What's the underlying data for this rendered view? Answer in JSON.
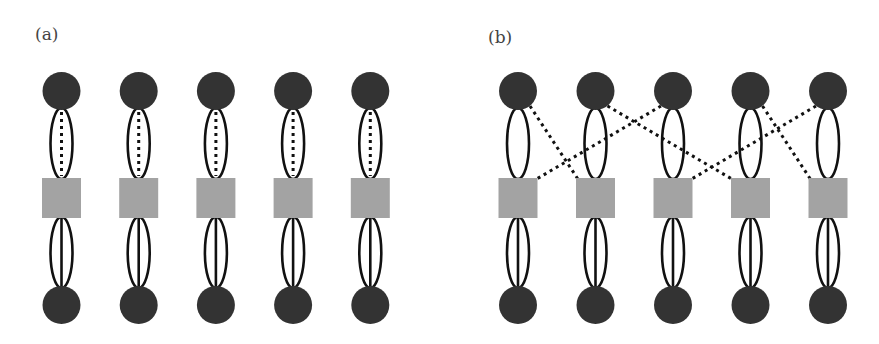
{
  "panels": [
    {
      "id": "a",
      "label": "(a)",
      "units": 5,
      "dotted_links": [
        [
          1,
          1
        ],
        [
          2,
          2
        ],
        [
          3,
          3
        ],
        [
          4,
          4
        ],
        [
          5,
          5
        ]
      ]
    },
    {
      "id": "b",
      "label": "(b)",
      "units": 5,
      "dotted_links": [
        [
          1,
          2
        ],
        [
          2,
          4
        ],
        [
          3,
          1
        ],
        [
          4,
          5
        ],
        [
          5,
          3
        ]
      ]
    }
  ],
  "colors": {
    "node_fill": "#333333",
    "square_fill": "#a3a3a3",
    "line": "#111111",
    "background": "#ffffff"
  },
  "legend": {
    "top_node": "dark circle",
    "middle_node": "gray square",
    "bottom_node": "dark circle",
    "top_connection": "two solid curves forming an ellipse plus a dotted link",
    "bottom_connection": "two solid curves forming an ellipse plus a straight solid line"
  }
}
